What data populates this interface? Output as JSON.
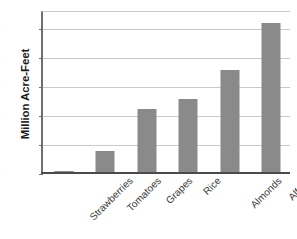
{
  "chart_data": {
    "type": "bar",
    "title": "",
    "xlabel": "",
    "ylabel": "Million Acre-Feet",
    "categories": [
      "Strawberries",
      "Tomatoes",
      "Grapes",
      "Rice",
      "Almonds",
      "Alfalfa"
    ],
    "values": [
      0.08,
      0.75,
      2.2,
      2.55,
      3.55,
      5.2
    ],
    "ylim": [
      0,
      5.6
    ],
    "yticks": [
      0,
      1,
      2,
      3,
      4,
      5
    ],
    "ytick_labels": [
      "0",
      "1",
      "2",
      "3",
      "4",
      "5"
    ],
    "grid": true,
    "legend": false,
    "bar_color": "#8a8a8a",
    "grid_color": "#c9c9c9",
    "axis_color": "#6f6f6f",
    "background": "#ffffff"
  }
}
